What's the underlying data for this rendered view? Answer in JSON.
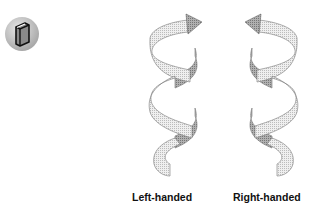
{
  "figure": {
    "icon": "book-icon",
    "helices": [
      {
        "label": "Left-handed",
        "handedness": "left",
        "arrow_direction": "right"
      },
      {
        "label": "Right-handed",
        "handedness": "right",
        "arrow_direction": "left"
      }
    ]
  },
  "colors": {
    "ribbon_light": "#e6e6e6",
    "ribbon_dark": "#9a9a9a",
    "outline": "#777777",
    "badge_bg": "#bdbdbd"
  }
}
